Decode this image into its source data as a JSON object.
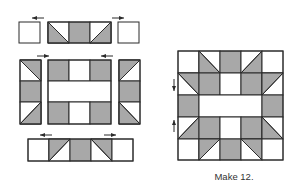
{
  "caption": "Make 12.",
  "colors": {
    "fill": "#a8a8a8",
    "background": "#ffffff",
    "stroke": "#2b2b2b"
  },
  "diagram": {
    "assembly_rows": [
      {
        "name": "top-row",
        "units": [
          "plain-square",
          "flying-geese-strip",
          "plain-square"
        ],
        "press_arrows": [
          "left",
          "right"
        ]
      },
      {
        "name": "middle-row",
        "units": [
          "side-column",
          "center-unit",
          "side-column"
        ],
        "press_arrows": [
          "right",
          "left"
        ]
      },
      {
        "name": "bottom-row",
        "units": [
          "square",
          "hst",
          "square",
          "hst",
          "square"
        ],
        "press_arrows": [
          "left",
          "right"
        ]
      }
    ],
    "finished_block": {
      "grid": "5x5",
      "press_arrows": [
        "down",
        "up"
      ]
    }
  }
}
